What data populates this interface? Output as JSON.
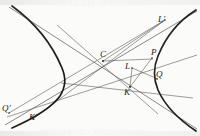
{
  "figure": {
    "background_color": "#fbfbfa",
    "ink_color": "#1d1d1d",
    "thin_line_color": "#5a5a5a",
    "width": 200,
    "height": 136,
    "labels": [
      {
        "id": "L-prime",
        "text": "L'",
        "x": 158,
        "y": 15
      },
      {
        "id": "C",
        "text": "C",
        "x": 100,
        "y": 51
      },
      {
        "id": "P",
        "text": "P",
        "x": 151,
        "y": 50
      },
      {
        "id": "L",
        "text": "L",
        "x": 126,
        "y": 63
      },
      {
        "id": "Q",
        "text": "Q",
        "x": 155,
        "y": 71
      },
      {
        "id": "K",
        "text": "K",
        "x": 124,
        "y": 84
      },
      {
        "id": "Q-prime",
        "text": "Q'",
        "x": 3,
        "y": 101
      },
      {
        "id": "K-prime",
        "text": "K'",
        "x": 30,
        "y": 112
      }
    ],
    "bleed_text": {
      "top": "THE CONIC SECTIONS",
      "bottom": "PROJECTIVE GEOMETRY"
    },
    "geometry": {
      "curve_type": "hyperbola",
      "branches": 2,
      "left_branch_vertex": [
        64,
        78
      ],
      "right_branch_vertex": [
        156,
        72
      ],
      "center": [
        103,
        60
      ],
      "asymptote_upper_left_to_lower_right": [
        [
          10,
          8
        ],
        [
          196,
          128
        ]
      ],
      "asymptote_lower_left_to_upper_right": [
        [
          6,
          124
        ],
        [
          196,
          12
        ]
      ],
      "chords": [
        {
          "name": "chord-C-to-Lprime",
          "from": [
            103,
            60
          ],
          "to": [
            163,
            22
          ]
        },
        {
          "name": "chord-Qprime-to-Lprime",
          "from": [
            10,
            112
          ],
          "to": [
            163,
            22
          ]
        },
        {
          "name": "chord-C-to-P",
          "from": [
            103,
            60
          ],
          "to": [
            152,
            58
          ]
        },
        {
          "name": "chord-K-to-P",
          "from": [
            130,
            86
          ],
          "to": [
            152,
            58
          ]
        },
        {
          "name": "chord-K-to-L",
          "from": [
            130,
            86
          ],
          "to": [
            131,
            67
          ]
        },
        {
          "name": "chord-L-to-Q",
          "from": [
            131,
            67
          ],
          "to": [
            157,
            78
          ]
        },
        {
          "name": "chord-leftvertex-to-Q",
          "from": [
            62,
            82
          ],
          "to": [
            176,
            95
          ]
        },
        {
          "name": "chord-Kprime-to-Lprime",
          "from": [
            34,
            118
          ],
          "to": [
            163,
            22
          ]
        },
        {
          "name": "chord-C-to-K",
          "from": [
            60,
            28
          ],
          "to": [
            148,
            106
          ]
        },
        {
          "name": "chord-Qprime-to-upper-right",
          "from": [
            8,
            116
          ],
          "to": [
            196,
            58
          ]
        }
      ]
    }
  }
}
